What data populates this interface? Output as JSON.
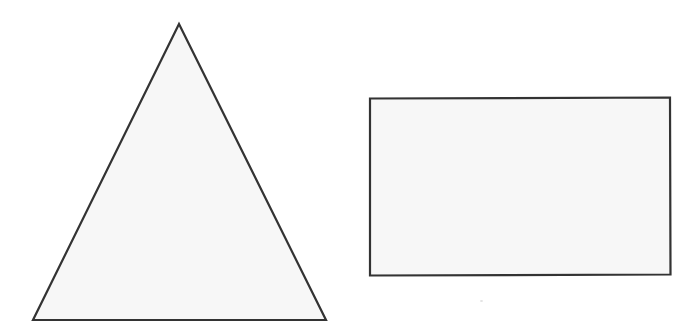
{
  "figure": {
    "canvas": {
      "width": 699,
      "height": 332,
      "background_color": "#ffffff"
    },
    "style": {
      "fill_color": "#f7f7f7",
      "stroke_color": "#333333",
      "stroke_width": 2.2
    },
    "shapes": [
      {
        "id": "triangle",
        "name": "triangle",
        "kind": "polygon",
        "label": "Triangle",
        "points": "179,24 326,320 33,320",
        "vertices": [
          {
            "name": "apex",
            "x": 179,
            "y": 24
          },
          {
            "name": "base-right",
            "x": 326,
            "y": 320
          },
          {
            "name": "base-left",
            "x": 33,
            "y": 320
          }
        ],
        "base_width": 293,
        "height": 296,
        "fill_color": "#f7f7f7",
        "stroke_color": "#333333",
        "stroke_width": 2.2
      },
      {
        "id": "rectangle",
        "name": "rectangle",
        "kind": "polygon",
        "label": "Rectangle",
        "points": "370,98.5 670,97.5 670.5,274.5 370,275.5",
        "vertices": [
          {
            "name": "top-left",
            "x": 370,
            "y": 98.5
          },
          {
            "name": "top-right",
            "x": 670,
            "y": 97.5
          },
          {
            "name": "bottom-right",
            "x": 670.5,
            "y": 274.5
          },
          {
            "name": "bottom-left",
            "x": 370,
            "y": 275.5
          }
        ],
        "width": 300,
        "height": 177,
        "fill_color": "#f7f7f7",
        "stroke_color": "#333333",
        "stroke_width": 2.2
      }
    ],
    "artifacts": [
      {
        "id": "scan-speck",
        "name": "scan-speck",
        "x": 480,
        "y": 300,
        "color": "#dedede"
      }
    ]
  }
}
